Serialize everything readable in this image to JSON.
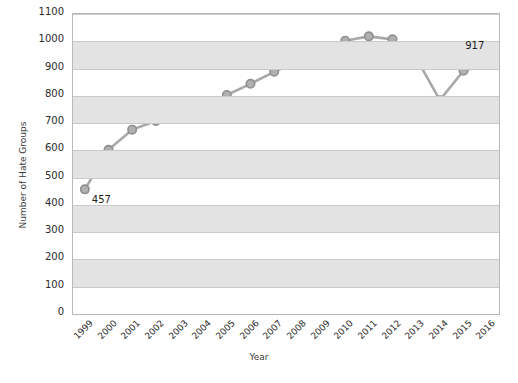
{
  "chart_data": {
    "type": "line",
    "title": "",
    "xlabel": "Year",
    "ylabel": "Number of Hate Groups",
    "categories": [
      "1999",
      "2000",
      "2001",
      "2002",
      "2003",
      "2004",
      "2005",
      "2006",
      "2007",
      "2008",
      "2009",
      "2010",
      "2011",
      "2012",
      "2013",
      "2014",
      "2015",
      "2016"
    ],
    "values": [
      457,
      602,
      676,
      708,
      751,
      762,
      803,
      844,
      888,
      926,
      932,
      1002,
      1018,
      1007,
      939,
      784,
      892,
      917
    ],
    "ylim": [
      0,
      1100
    ],
    "ytick_step": 100,
    "yticks": [
      "0",
      "100",
      "200",
      "300",
      "400",
      "500",
      "600",
      "700",
      "800",
      "900",
      "1000",
      "1100"
    ],
    "grid": true,
    "banded_background": true,
    "legend": "none",
    "annotations": [
      {
        "label": "457",
        "x": "1999",
        "y": 457
      },
      {
        "label": "917",
        "x": "2016",
        "y": 917
      }
    ],
    "series": [
      {
        "name": "Number of Hate Groups",
        "values": [
          457,
          602,
          676,
          708,
          751,
          762,
          803,
          844,
          888,
          926,
          932,
          1002,
          1018,
          1007,
          939,
          784,
          892,
          917
        ],
        "line_color": "#a8a8a8",
        "marker_color": "#b0b0b0",
        "marker_edge_color": "#8f8f8f"
      }
    ],
    "colors": {
      "band": "#e3e3e3",
      "gridline": "#c9c9c9",
      "plot_border": "#b9b9b9",
      "background": "#ffffff",
      "text": "#2b2b2b"
    }
  }
}
